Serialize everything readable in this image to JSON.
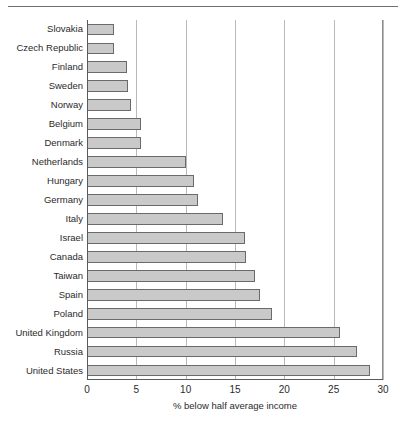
{
  "chart_data": {
    "type": "bar",
    "orientation": "horizontal",
    "title": "",
    "xlabel": "% below half average income",
    "ylabel": "",
    "xlim": [
      0,
      30
    ],
    "xticks": [
      0,
      5,
      10,
      15,
      20,
      25,
      30
    ],
    "grid": true,
    "legend": false,
    "categories": [
      "Slovakia",
      "Czech Republic",
      "Finland",
      "Sweden",
      "Norway",
      "Belgium",
      "Denmark",
      "Netherlands",
      "Hungary",
      "Germany",
      "Italy",
      "Israel",
      "Canada",
      "Taiwan",
      "Spain",
      "Poland",
      "United Kingdom",
      "Russia",
      "United States"
    ],
    "values": [
      2.7,
      2.7,
      4.1,
      4.2,
      4.5,
      5.5,
      5.5,
      10.0,
      10.8,
      11.3,
      13.8,
      16.0,
      16.1,
      17.0,
      17.5,
      18.7,
      25.6,
      27.4,
      28.7
    ]
  },
  "style": {
    "bar_fill": "#c9c9c9",
    "bar_border": "#6a6a6a",
    "gridline_color": "#b9b9b9",
    "axis_color": "#5a5a5a",
    "text_color": "#2b2b2b",
    "rule_color": "#6f6f6f",
    "background": "#ffffff"
  }
}
